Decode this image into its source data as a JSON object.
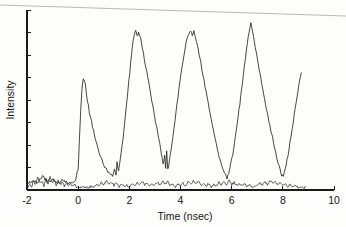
{
  "figure": {
    "name": "intensity-vs-time-trace",
    "background_color": "#fdfdfc",
    "ink_color": "#262626",
    "scan_artifact": {
      "present": true,
      "description": "slanted grey scan edge line across top of image",
      "color": "#b9b9b9"
    }
  },
  "chart_data": {
    "type": "line",
    "title": "",
    "subtitle": "",
    "xlabel": "Time (nsec)",
    "ylabel": "Intensity",
    "xlim": [
      -2,
      10
    ],
    "ylim": [
      0,
      1
    ],
    "grid": false,
    "legend": null,
    "xticks": [
      -2,
      0,
      2,
      4,
      6,
      8,
      10
    ],
    "xticklabels": [
      "-2",
      "0",
      "2",
      "4",
      "6",
      "8",
      "10"
    ],
    "yticks": [
      0.0,
      0.125,
      0.25,
      0.375,
      0.5,
      0.625,
      0.75,
      0.875,
      1.0
    ],
    "yticklabels": [
      "",
      "",
      "",
      "",
      "",
      "",
      "",
      "",
      ""
    ],
    "y_axis_labeled": false,
    "annotations": [],
    "series": [
      {
        "name": "signal",
        "description": "pulse train, four resolved peaks plus onset of a fifth",
        "peaks": [
          {
            "t": 0.2,
            "intensity": 0.62
          },
          {
            "t": 2.25,
            "intensity": 0.88
          },
          {
            "t": 4.45,
            "intensity": 0.89
          },
          {
            "t": 6.75,
            "intensity": 0.93
          },
          {
            "t": 8.7,
            "intensity": 0.65
          }
        ],
        "valleys": [
          {
            "t": 1.35,
            "intensity": 0.07
          },
          {
            "t": 3.35,
            "intensity": 0.09
          },
          {
            "t": 5.7,
            "intensity": 0.06
          },
          {
            "t": 7.95,
            "intensity": 0.06
          }
        ],
        "period_nsec": 2.2,
        "x": [
          -2.0,
          -1.8,
          -1.6,
          -1.4,
          -1.2,
          -1.0,
          -0.8,
          -0.6,
          -0.4,
          -0.2,
          -0.1,
          0.0,
          0.05,
          0.1,
          0.15,
          0.2,
          0.28,
          0.36,
          0.44,
          0.52,
          0.6,
          0.7,
          0.8,
          0.9,
          1.0,
          1.1,
          1.2,
          1.3,
          1.35,
          1.42,
          1.48,
          1.52,
          1.58,
          1.65,
          1.75,
          1.85,
          1.95,
          2.05,
          2.12,
          2.18,
          2.25,
          2.3,
          2.36,
          2.44,
          2.55,
          2.65,
          2.75,
          2.85,
          2.95,
          3.05,
          3.15,
          3.25,
          3.32,
          3.38,
          3.42,
          3.46,
          3.5,
          3.56,
          3.64,
          3.74,
          3.86,
          3.98,
          4.1,
          4.22,
          4.32,
          4.4,
          4.46,
          4.52,
          4.58,
          4.66,
          4.76,
          4.88,
          5.0,
          5.12,
          5.24,
          5.36,
          5.48,
          5.58,
          5.66,
          5.74,
          5.82,
          5.92,
          6.04,
          6.18,
          6.32,
          6.46,
          6.58,
          6.68,
          6.75,
          6.82,
          6.92,
          7.04,
          7.18,
          7.32,
          7.46,
          7.6,
          7.72,
          7.82,
          7.9,
          7.96,
          8.02,
          8.1,
          8.2,
          8.32,
          8.44,
          8.56,
          8.66,
          8.72
        ],
        "y": [
          0.035,
          0.05,
          0.042,
          0.075,
          0.048,
          0.06,
          0.04,
          0.055,
          0.038,
          0.045,
          0.06,
          0.12,
          0.28,
          0.45,
          0.57,
          0.62,
          0.585,
          0.5,
          0.43,
          0.38,
          0.33,
          0.27,
          0.22,
          0.175,
          0.14,
          0.115,
          0.095,
          0.08,
          0.07,
          0.11,
          0.075,
          0.15,
          0.105,
          0.175,
          0.28,
          0.42,
          0.56,
          0.7,
          0.8,
          0.86,
          0.88,
          0.855,
          0.87,
          0.84,
          0.76,
          0.68,
          0.6,
          0.52,
          0.44,
          0.36,
          0.29,
          0.2,
          0.14,
          0.19,
          0.12,
          0.21,
          0.115,
          0.15,
          0.23,
          0.34,
          0.47,
          0.6,
          0.72,
          0.82,
          0.87,
          0.885,
          0.855,
          0.88,
          0.845,
          0.8,
          0.73,
          0.64,
          0.545,
          0.45,
          0.36,
          0.28,
          0.2,
          0.15,
          0.11,
          0.085,
          0.07,
          0.11,
          0.2,
          0.33,
          0.48,
          0.64,
          0.78,
          0.88,
          0.93,
          0.88,
          0.8,
          0.7,
          0.59,
          0.48,
          0.38,
          0.29,
          0.21,
          0.15,
          0.105,
          0.08,
          0.075,
          0.12,
          0.19,
          0.3,
          0.41,
          0.52,
          0.61,
          0.65
        ]
      },
      {
        "name": "baseline-noise",
        "description": "low-amplitude noise trace riding on the zero baseline across the full record",
        "x": [
          -2.0,
          -1.9,
          -1.82,
          -1.74,
          -1.66,
          -1.58,
          -1.5,
          -1.42,
          -1.34,
          -1.26,
          -1.18,
          -1.1,
          -1.02,
          -0.94,
          -0.86,
          -0.78,
          -0.7,
          -0.62,
          -0.54,
          -0.46,
          -0.38,
          -0.3,
          -0.22,
          -0.14,
          -0.06,
          0.02,
          0.1,
          0.18,
          0.26,
          0.34,
          0.42,
          0.5,
          0.6,
          0.7,
          0.8,
          0.9,
          1.0,
          1.1,
          1.2,
          1.3,
          1.4,
          1.5,
          1.6,
          1.7,
          1.8,
          1.9,
          2.0,
          2.1,
          2.2,
          2.3,
          2.4,
          2.5,
          2.6,
          2.7,
          2.8,
          2.9,
          3.0,
          3.1,
          3.2,
          3.3,
          3.4,
          3.5,
          3.6,
          3.7,
          3.8,
          3.9,
          4.0,
          4.1,
          4.2,
          4.3,
          4.4,
          4.5,
          4.6,
          4.7,
          4.8,
          4.9,
          5.0,
          5.1,
          5.2,
          5.3,
          5.4,
          5.5,
          5.6,
          5.7,
          5.8,
          5.9,
          6.0,
          6.1,
          6.2,
          6.3,
          6.4,
          6.5,
          6.6,
          6.7,
          6.8,
          6.9,
          7.0,
          7.1,
          7.2,
          7.3,
          7.4,
          7.5,
          7.6,
          7.7,
          7.8,
          7.9,
          8.0,
          8.1,
          8.2,
          8.3,
          8.4,
          8.5,
          8.6,
          8.7,
          8.8,
          8.9
        ],
        "y": [
          0.01,
          0.03,
          0.018,
          0.055,
          0.028,
          0.07,
          0.035,
          0.048,
          0.022,
          0.062,
          0.03,
          0.075,
          0.04,
          0.055,
          0.025,
          0.058,
          0.032,
          0.048,
          0.02,
          0.042,
          0.026,
          0.038,
          0.018,
          0.03,
          0.014,
          0.022,
          0.012,
          0.02,
          0.01,
          0.018,
          0.012,
          0.024,
          0.016,
          0.03,
          0.022,
          0.04,
          0.028,
          0.052,
          0.034,
          0.046,
          0.024,
          0.038,
          0.02,
          0.032,
          0.016,
          0.028,
          0.018,
          0.034,
          0.022,
          0.042,
          0.026,
          0.048,
          0.03,
          0.04,
          0.02,
          0.036,
          0.024,
          0.044,
          0.028,
          0.05,
          0.032,
          0.046,
          0.022,
          0.038,
          0.018,
          0.03,
          0.02,
          0.036,
          0.026,
          0.044,
          0.03,
          0.052,
          0.034,
          0.048,
          0.026,
          0.04,
          0.022,
          0.034,
          0.018,
          0.03,
          0.024,
          0.042,
          0.028,
          0.046,
          0.032,
          0.05,
          0.03,
          0.044,
          0.024,
          0.038,
          0.02,
          0.032,
          0.018,
          0.028,
          0.016,
          0.026,
          0.02,
          0.036,
          0.026,
          0.046,
          0.032,
          0.054,
          0.036,
          0.05,
          0.028,
          0.042,
          0.024,
          0.036,
          0.02,
          0.03,
          0.016,
          0.026,
          0.014,
          0.022,
          0.012,
          0.018
        ]
      }
    ]
  }
}
